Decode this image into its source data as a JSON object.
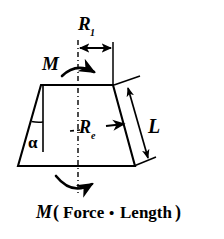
{
  "figure": {
    "type": "engineering-diagram",
    "shape": {
      "name": "trapezoid",
      "top_left": [
        41,
        85
      ],
      "top_right": [
        113,
        85
      ],
      "bottom_right": [
        135,
        166
      ],
      "bottom_left": [
        18,
        166
      ],
      "stroke_color": "#000000",
      "fill_color": "#ffffff"
    },
    "centerline": {
      "name": "vertical-center-axis",
      "style": "dash-dot",
      "x": 78,
      "y_top": 40,
      "y_bottom": 196,
      "color": "#000000"
    }
  },
  "labels": {
    "top_radius": "R",
    "top_radius_subscript": "1",
    "effective_radius": "R",
    "effective_radius_subscript": "e",
    "slant_length": "L",
    "angle": "α",
    "moment_top": "M",
    "moment_bottom": "M",
    "caption": "M ( Force • Length )",
    "caption_parts": {
      "symbol": "M",
      "open_paren": "(",
      "force": "Force",
      "dot": "•",
      "length": "Length",
      "close_paren": ")"
    }
  },
  "dimensions": {
    "r1": {
      "name": "R1 top radius dimension",
      "arrow": "double-headed",
      "from": [
        78,
        48
      ],
      "to": [
        113,
        48
      ],
      "label_position": [
        88,
        30
      ]
    },
    "re": {
      "name": "Re effective radius leader",
      "arrow": "single-headed-right",
      "from": [
        84,
        128
      ],
      "to": [
        123,
        124
      ],
      "leader_style": "dashed",
      "label_position": [
        88,
        132
      ]
    },
    "l": {
      "name": "L slant length dimension",
      "arrow": "double-headed",
      "from": [
        126,
        84
      ],
      "to": [
        150,
        165
      ],
      "label_position": [
        150,
        127
      ]
    },
    "alpha": {
      "name": "alpha half-angle",
      "vertex": [
        41,
        85
      ],
      "arc_radius": 34,
      "label_position": [
        36,
        146
      ]
    }
  },
  "moment_arrows": {
    "top": {
      "name": "top-moment-curved-arrow",
      "direction": "clockwise-right",
      "label_position": [
        53,
        72
      ]
    },
    "bottom": {
      "name": "bottom-moment-curved-arrow",
      "direction": "clockwise-right",
      "label_position": null
    }
  },
  "colors": {
    "ink": "#000000",
    "background": "#ffffff"
  }
}
